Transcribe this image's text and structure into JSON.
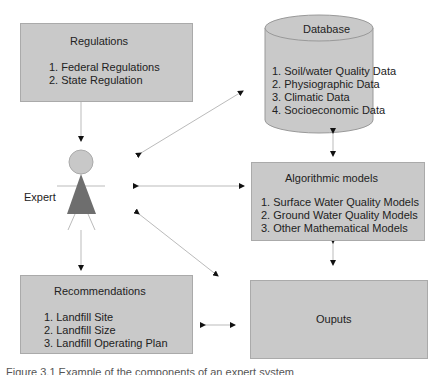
{
  "regulations": {
    "title": "Regulations",
    "items": [
      "1. Federal Regulations",
      "2. State Regulation"
    ]
  },
  "database": {
    "title": "Database",
    "items": [
      "1. Soil/water Quality Data",
      "2. Physiographic Data",
      "3. Climatic Data",
      "4. Socioeconomic Data"
    ]
  },
  "expert": {
    "label": "Expert"
  },
  "algorithmic_models": {
    "title": "Algorithmic models",
    "items": [
      "1. Surface Water Quality Models",
      "2. Ground Water Quality Models",
      "3. Other Mathematical Models"
    ]
  },
  "recommendations": {
    "title": "Recommendations",
    "items": [
      "1. Landfill Site",
      "2. Landfill Size",
      "3. Landfill Operating Plan"
    ]
  },
  "outputs": {
    "title": "Ouputs"
  },
  "caption": "Figure 3.1 Example of the components of an expert system",
  "colors": {
    "box_fill": "#c9c9c9",
    "expert_head": "#c8c8c8",
    "expert_body": "#6e6e6e"
  }
}
